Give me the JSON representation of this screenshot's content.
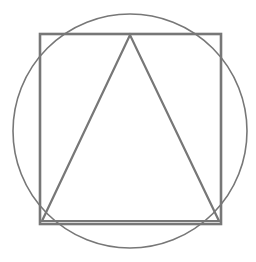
{
  "diagram": {
    "stroke_color": "#777777",
    "background": "#ffffff",
    "shapes": {
      "circle": {
        "cx": 130,
        "cy": 131,
        "r": 117,
        "stroke_width": 1.6
      },
      "square": {
        "x": 40,
        "y": 34,
        "width": 181,
        "height": 190,
        "stroke_width": 2.6
      },
      "triangle": {
        "points": "130,35 42,221 219,221",
        "stroke_width": 2.2
      }
    }
  }
}
